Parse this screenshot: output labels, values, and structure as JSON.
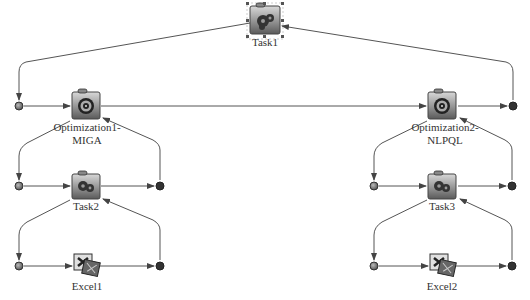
{
  "diagram": {
    "background": "#ffffff",
    "line_color": "#555555",
    "nodes": [
      {
        "id": "task1",
        "label": "Task1",
        "type": "task",
        "selected": true,
        "x": 265,
        "y": 21
      },
      {
        "id": "opt1",
        "label_line1": "Optimization1-",
        "label_line2": "MIGA",
        "type": "optimization",
        "x": 85,
        "y": 103
      },
      {
        "id": "opt2",
        "label_line1": "Optimization2-",
        "label_line2": "NLPQL",
        "type": "optimization",
        "x": 442,
        "y": 103
      },
      {
        "id": "task2",
        "label": "Task2",
        "type": "task",
        "x": 85,
        "y": 186
      },
      {
        "id": "task3",
        "label": "Task3",
        "type": "task",
        "x": 442,
        "y": 186
      },
      {
        "id": "excel1",
        "label": "Excel1",
        "type": "excel",
        "x": 85,
        "y": 265
      },
      {
        "id": "excel2",
        "label": "Excel2",
        "type": "excel",
        "x": 442,
        "y": 265
      }
    ],
    "ports": {
      "opt_in_left": {
        "x": 19,
        "y": 106,
        "kind": "start"
      },
      "opt_out_right": {
        "x": 513,
        "y": 106,
        "kind": "end"
      },
      "task2_in": {
        "x": 19,
        "y": 186,
        "kind": "start"
      },
      "task2_out": {
        "x": 160,
        "y": 186,
        "kind": "end"
      },
      "task3_in": {
        "x": 374,
        "y": 186,
        "kind": "start"
      },
      "task3_out": {
        "x": 512,
        "y": 186,
        "kind": "end"
      },
      "excel1_in": {
        "x": 19,
        "y": 266,
        "kind": "start"
      },
      "excel1_out": {
        "x": 160,
        "y": 266,
        "kind": "end"
      },
      "excel2_in": {
        "x": 374,
        "y": 266,
        "kind": "start"
      },
      "excel2_out": {
        "x": 512,
        "y": 266,
        "kind": "end"
      }
    }
  }
}
